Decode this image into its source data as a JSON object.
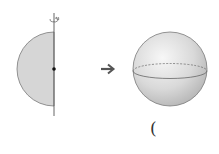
{
  "diagram": {
    "left_figure": {
      "label": "semicircle-with-rotation-axis",
      "fill": "#d6d6d6",
      "stroke": "#7a7a7a"
    },
    "arrow": {
      "glyph": "→",
      "color": "#555555"
    },
    "right_figure": {
      "label": "sphere",
      "fill_light": "#f4f4f4",
      "fill_dark": "#bdbdbd",
      "stroke": "#7a7a7a"
    },
    "answer_paren": "("
  }
}
